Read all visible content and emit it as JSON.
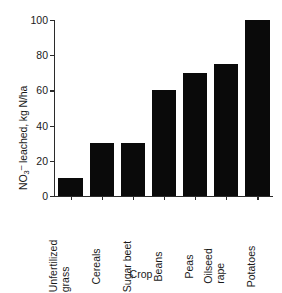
{
  "chart_data": {
    "type": "bar",
    "title": "",
    "subtitle": "",
    "xlabel": "Crop",
    "ylabel": "NO3- leached, kg N/ha",
    "ylabel_parts": {
      "prefix": "NO",
      "sub": "3",
      "sup": "–",
      "suffix": " leached, kg N/ha"
    },
    "categories": [
      "Unfertilized grass",
      "Cereals",
      "Sugar beet",
      "Beans",
      "Peas",
      "Oilseed rape",
      "Potatoes"
    ],
    "category_lines": [
      [
        "Unfertilized",
        "grass"
      ],
      [
        "Cereals"
      ],
      [
        "Sugar beet"
      ],
      [
        "Beans"
      ],
      [
        "Peas"
      ],
      [
        "Oilseed",
        "rape"
      ],
      [
        "Potatoes"
      ]
    ],
    "values": [
      10,
      30,
      30,
      60,
      70,
      75,
      100
    ],
    "ylim": [
      0,
      100
    ],
    "yticks": [
      0,
      20,
      40,
      60,
      80,
      100
    ],
    "ytick_labels": [
      "0",
      "20",
      "40",
      "60",
      "80",
      "100"
    ],
    "grid": false,
    "legend": false,
    "legend_position": "none",
    "bar_color": "#0a0a0a",
    "axis_color": "#2b2b2b",
    "background_color": "#ffffff"
  }
}
